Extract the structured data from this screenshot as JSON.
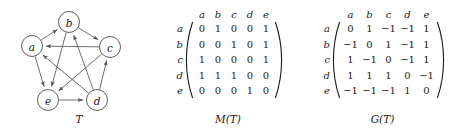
{
  "figure": {
    "graph": {
      "caption": "T",
      "nodes": [
        {
          "id": "a",
          "label": "a",
          "cx": 32,
          "cy": 46
        },
        {
          "id": "b",
          "label": "b",
          "cx": 69,
          "cy": 22
        },
        {
          "id": "c",
          "label": "c",
          "cx": 110,
          "cy": 47
        },
        {
          "id": "d",
          "label": "d",
          "cx": 97,
          "cy": 100
        },
        {
          "id": "e",
          "label": "e",
          "cx": 48,
          "cy": 100
        }
      ],
      "node_radius": 10.5,
      "edges": [
        {
          "from": "a",
          "to": "b"
        },
        {
          "from": "a",
          "to": "e"
        },
        {
          "from": "b",
          "to": "c"
        },
        {
          "from": "b",
          "to": "e"
        },
        {
          "from": "c",
          "to": "a"
        },
        {
          "from": "c",
          "to": "e"
        },
        {
          "from": "d",
          "to": "a"
        },
        {
          "from": "d",
          "to": "b"
        },
        {
          "from": "d",
          "to": "c"
        },
        {
          "from": "e",
          "to": "d"
        }
      ],
      "edge_color": "#555555",
      "node_stroke": "#4c4c4c"
    },
    "matrix_m": {
      "caption": "M(T)",
      "col_headers": [
        "a",
        "b",
        "c",
        "d",
        "e"
      ],
      "row_headers": [
        "a",
        "b",
        "c",
        "d",
        "e"
      ],
      "rows": [
        [
          "0",
          "1",
          "0",
          "0",
          "1"
        ],
        [
          "0",
          "0",
          "1",
          "0",
          "1"
        ],
        [
          "1",
          "0",
          "0",
          "0",
          "1"
        ],
        [
          "1",
          "1",
          "1",
          "0",
          "0"
        ],
        [
          "0",
          "0",
          "0",
          "1",
          "0"
        ]
      ]
    },
    "matrix_g": {
      "caption": "G(T)",
      "col_headers": [
        "a",
        "b",
        "c",
        "d",
        "e"
      ],
      "row_headers": [
        "a",
        "b",
        "c",
        "d",
        "e"
      ],
      "rows": [
        [
          "0",
          "1",
          "−1",
          "−1",
          "1"
        ],
        [
          "−1",
          "0",
          "1",
          "−1",
          "1"
        ],
        [
          "1",
          "−1",
          "0",
          "−1",
          "1"
        ],
        [
          "1",
          "1",
          "1",
          "0",
          "−1"
        ],
        [
          "−1",
          "−1",
          "−1",
          "1",
          "0"
        ]
      ]
    }
  }
}
